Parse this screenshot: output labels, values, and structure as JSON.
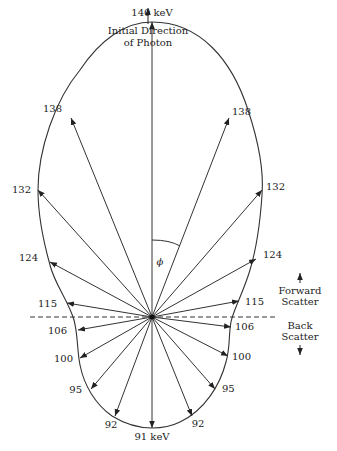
{
  "title": {
    "line1": "Initial Direction",
    "line2": "of Photon"
  },
  "angle_symbol": "ϕ",
  "regions": {
    "forward": {
      "line1": "Forward",
      "line2": "Scatter"
    },
    "back": {
      "line1": "Back",
      "line2": "Scatter"
    }
  },
  "arrows": [
    {
      "label": "140 keV",
      "tip": [
        152,
        22
      ],
      "lx": 152,
      "ly": 16,
      "anchor": "middle"
    },
    {
      "label": "138",
      "tip": [
        71,
        118
      ],
      "lx": 62,
      "ly": 112,
      "anchor": "end"
    },
    {
      "label": "138",
      "tip": [
        229,
        118
      ],
      "lx": 232,
      "ly": 115,
      "anchor": "start"
    },
    {
      "label": "132",
      "tip": [
        38,
        190
      ],
      "lx": 31,
      "ly": 193,
      "anchor": "end"
    },
    {
      "label": "132",
      "tip": [
        262,
        190
      ],
      "lx": 266,
      "ly": 190,
      "anchor": "start"
    },
    {
      "label": "124",
      "tip": [
        50,
        262
      ],
      "lx": 38,
      "ly": 261,
      "anchor": "end"
    },
    {
      "label": "124",
      "tip": [
        256,
        259
      ],
      "lx": 263,
      "ly": 258,
      "anchor": "start"
    },
    {
      "label": "115",
      "tip": [
        67,
        303
      ],
      "lx": 57,
      "ly": 307,
      "anchor": "end"
    },
    {
      "label": "115",
      "tip": [
        239,
        301
      ],
      "lx": 245,
      "ly": 305,
      "anchor": "start"
    },
    {
      "label": "106",
      "tip": [
        78,
        330
      ],
      "lx": 67,
      "ly": 334,
      "anchor": "end"
    },
    {
      "label": "106",
      "tip": [
        231,
        327
      ],
      "lx": 235,
      "ly": 330,
      "anchor": "start"
    },
    {
      "label": "100",
      "tip": [
        80,
        358
      ],
      "lx": 73,
      "ly": 362,
      "anchor": "end"
    },
    {
      "label": "100",
      "tip": [
        228,
        356
      ],
      "lx": 232,
      "ly": 360,
      "anchor": "start"
    },
    {
      "label": "95",
      "tip": [
        91,
        389
      ],
      "lx": 82,
      "ly": 393,
      "anchor": "end"
    },
    {
      "label": "95",
      "tip": [
        215,
        389
      ],
      "lx": 222,
      "ly": 392,
      "anchor": "start"
    },
    {
      "label": "92",
      "tip": [
        115,
        416
      ],
      "lx": 111,
      "ly": 428,
      "anchor": "middle"
    },
    {
      "label": "92",
      "tip": [
        192,
        416
      ],
      "lx": 198,
      "ly": 427,
      "anchor": "middle"
    },
    {
      "label": "91 keV",
      "tip": [
        152,
        428
      ],
      "lx": 152,
      "ly": 440,
      "anchor": "middle"
    }
  ],
  "chart_data": {
    "type": "polar-diagram",
    "title": "Initial Direction of Photon",
    "unit": "keV",
    "values_forward": [
      140,
      138,
      132,
      124,
      115
    ],
    "values_back": [
      106,
      100,
      95,
      92,
      91
    ],
    "all_labels": [
      "140 keV",
      "138",
      "132",
      "124",
      "115",
      "106",
      "100",
      "95",
      "92",
      "91 keV"
    ],
    "regions": [
      "Forward Scatter",
      "Back Scatter"
    ]
  }
}
